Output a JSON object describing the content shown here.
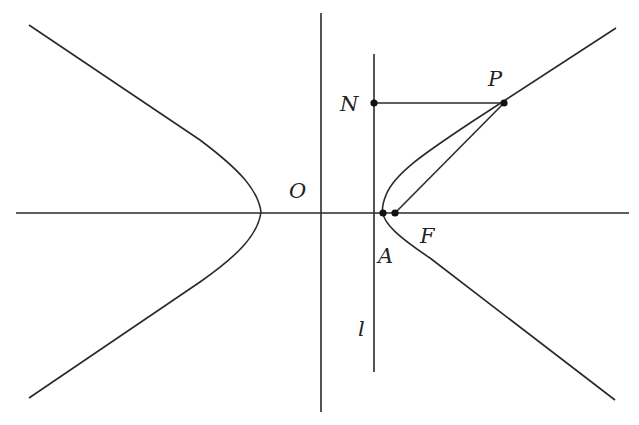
{
  "figure": {
    "colors": {
      "line": "#2a2a2a",
      "point": "#111111",
      "label": "#222222",
      "background": "#ffffff"
    },
    "labels": {
      "O": "O",
      "N": "N",
      "P": "P",
      "A": "A",
      "F": "F",
      "l": "l"
    },
    "axes": {
      "x_axis": {
        "from": [
          16,
          213
        ],
        "to": [
          629,
          213
        ]
      },
      "y_axis": {
        "from": [
          321,
          13
        ],
        "to": [
          321,
          412
        ]
      }
    },
    "directrix": {
      "name": "l",
      "from": [
        374,
        54
      ],
      "to": [
        374,
        372
      ]
    },
    "points": {
      "N": [
        374,
        103
      ],
      "P": [
        504,
        103
      ],
      "A": [
        383,
        213
      ],
      "F": [
        395,
        213
      ]
    },
    "hyperbola": {
      "left_branch": {
        "vertex": [
          261,
          212
        ],
        "top_end": [
          29,
          25
        ],
        "bottom_end": [
          29,
          398
        ]
      },
      "right_branch": {
        "vertex": [
          383,
          213
        ],
        "top_end": [
          616,
          28
        ],
        "bottom_end": [
          615,
          400
        ]
      }
    },
    "segments": [
      "NP",
      "PF"
    ]
  }
}
